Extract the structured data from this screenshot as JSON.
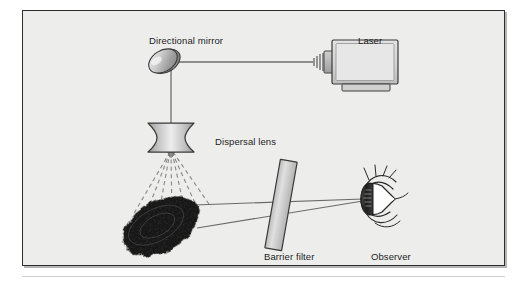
{
  "figure": {
    "background_color": "#ededec",
    "border_color": "#2d2d2d",
    "page_color": "#ffffff",
    "labels": {
      "directional_mirror": "Directional mirror",
      "laser": "Laser",
      "dispersal_lens": "Dispersal lens",
      "barrier_filter": "Barrier filter",
      "observer": "Observer"
    },
    "components": [
      {
        "name": "laser",
        "label": "Laser",
        "shape": "box-with-emitter",
        "fill": "#d6d6d6",
        "stroke": "#3a3a3a"
      },
      {
        "name": "directional-mirror",
        "label": "Directional mirror",
        "shape": "tilted-ellipse",
        "fill": "#c9c9c9",
        "stroke": "#3a3a3a"
      },
      {
        "name": "dispersal-lens",
        "label": "Dispersal lens",
        "shape": "biconcave-lens",
        "fill": "#cccccc",
        "stroke": "#3a3a3a"
      },
      {
        "name": "fingerprint-specimen",
        "label": "",
        "shape": "textured-oval",
        "fill": "#141414",
        "stroke": "#0c0c0c"
      },
      {
        "name": "barrier-filter",
        "label": "Barrier filter",
        "shape": "tilted-rectangle",
        "fill": "#d2d2d2",
        "stroke": "#3a3a3a"
      },
      {
        "name": "observer-eye",
        "label": "Observer",
        "shape": "eye-profile",
        "fill": "#ffffff",
        "stroke": "#2a2a2a"
      }
    ],
    "beams": [
      {
        "name": "laser-to-mirror-beam",
        "style": "solid",
        "from": "laser",
        "to": "directional-mirror",
        "color": "#6e6e6e"
      },
      {
        "name": "mirror-to-lens-beam",
        "style": "solid",
        "from": "directional-mirror",
        "to": "dispersal-lens",
        "color": "#6e6e6e"
      },
      {
        "name": "dispersed-light-rays",
        "style": "dashed",
        "from": "dispersal-lens",
        "to": "fingerprint-specimen",
        "color": "#8a8a8a",
        "ray_count": 7
      },
      {
        "name": "fluorescence-sight-lines",
        "style": "solid",
        "from": "fingerprint-specimen",
        "to": "observer-eye",
        "color": "#6a6a6a",
        "ray_count": 2
      }
    ]
  }
}
